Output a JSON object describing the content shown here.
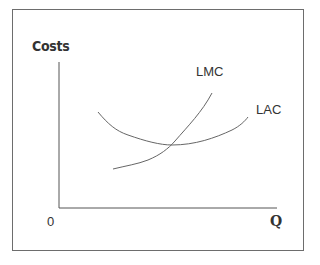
{
  "diagram": {
    "type": "economics-cost-curves",
    "y_axis_label": "Costs",
    "x_axis_label": "Q",
    "origin_label": "0",
    "curves": [
      {
        "name": "LMC",
        "label": "LMC",
        "description": "Long-run marginal cost, rising, crosses LAC at its minimum"
      },
      {
        "name": "LAC",
        "label": "LAC",
        "description": "Long-run average cost, U-shaped"
      }
    ],
    "colors": {
      "axis": "#555555",
      "curve": "#666666",
      "border": "#6d6d6d",
      "text": "#333333"
    }
  }
}
